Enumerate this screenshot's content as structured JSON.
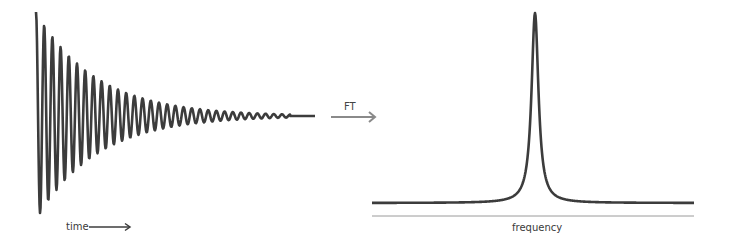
{
  "labels": {
    "time": "time",
    "transform": "FT",
    "frequency": "frequency"
  },
  "colors": {
    "signal": "#3c3c3c",
    "arrow": "#8a8a8a",
    "axis": "#9a9a9a",
    "text": "#3a3a3a"
  },
  "fid": {
    "x_start": 36,
    "x_end": 315,
    "center_y": 116,
    "initial_amplitude": 104,
    "decay_length_px": 60,
    "period_px": 8.2,
    "flat_tail_start": 290
  },
  "spectrum": {
    "x_start": 372,
    "x_end": 694,
    "peak_x": 535,
    "baseline_y": 203,
    "peak_y": 13,
    "half_width_px": 4.2
  },
  "time_arrow": {
    "x1": 89,
    "x2": 130,
    "y": 227
  },
  "ft_arrow": {
    "x1": 331,
    "x2": 375,
    "y": 117
  },
  "frequency_axis": {
    "x1": 372,
    "x2": 694,
    "y": 216
  }
}
